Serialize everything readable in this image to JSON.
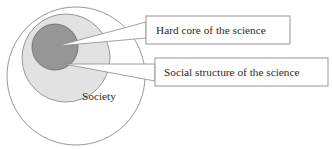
{
  "diagram": {
    "type": "concentric-circles-with-callouts",
    "title_visible": false,
    "circles": [
      {
        "id": "society",
        "label": "Society",
        "cx": 76,
        "cy": 76,
        "r": 69,
        "fill": "#ffffff",
        "stroke": "#8c8c8c"
      },
      {
        "id": "social-structure",
        "label": "",
        "cx": 66,
        "cy": 58,
        "r": 44,
        "fill": "#e2e2e2",
        "stroke": "#8c8c8c"
      },
      {
        "id": "hard-core",
        "label": "",
        "cx": 55,
        "cy": 47,
        "r": 23,
        "fill": "#969696",
        "stroke": "#6e6e6e"
      }
    ],
    "callouts": [
      {
        "id": "hard-core-callout",
        "text": "Hard core of the science",
        "box": {
          "x": 146,
          "y": 16,
          "width": 144,
          "height": 28
        },
        "anchor": {
          "x": 57,
          "y": 46
        },
        "notch": {
          "x": 139,
          "y": 22,
          "width": 7,
          "height": 16
        },
        "fill": "#ffffff",
        "stroke": "#8c8c8c"
      },
      {
        "id": "social-structure-callout",
        "text": "Social structure of the science",
        "box": {
          "x": 155,
          "y": 58,
          "width": 173,
          "height": 28
        },
        "anchor": {
          "x": 64,
          "y": 64
        },
        "notch": {
          "x": 146,
          "y": 64,
          "width": 9,
          "height": 17
        },
        "fill": "#ffffff",
        "stroke": "#8c8c8c"
      }
    ],
    "inner_label": {
      "text": "Society",
      "x": 82,
      "y": 100
    },
    "colors": {
      "outer_fill": "#ffffff",
      "middle_fill": "#e2e2e2",
      "core_fill": "#969696",
      "stroke": "#8c8c8c",
      "text": "#2b2b2b"
    }
  }
}
